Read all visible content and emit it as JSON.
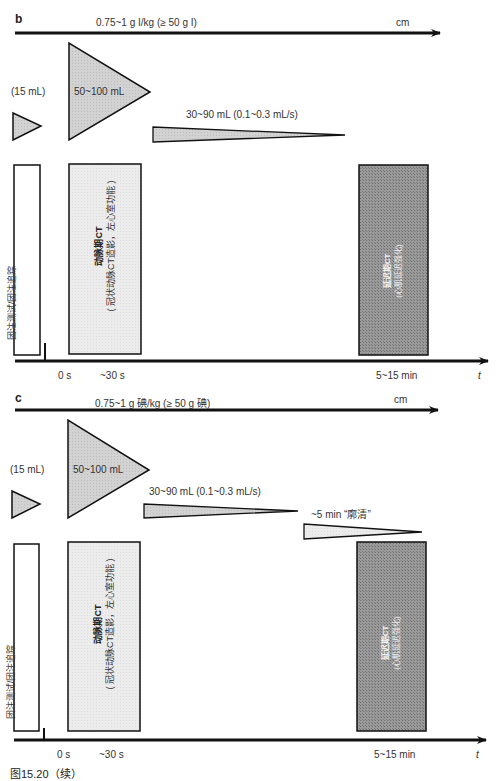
{
  "colors": {
    "line": "#111111",
    "triangle_fill": "#cccccc",
    "light_box_fill": "#ebebeb",
    "dark_box_fill": "#8a8a8a",
    "washout_fill": "#eeeeee"
  },
  "panels": [
    {
      "id": "b",
      "label": "b",
      "dose": "0.75~1 g I/kg (≥ 50 g I)",
      "dose_unit": "cm",
      "test_bolus": "(15 mL)",
      "main_bolus": "50~100 mL",
      "maintenance": "30~90 mL (0.1~0.3 mL/s)",
      "boxes": {
        "bolus_tracking": "团注测试/团注追踪",
        "arterial_title": "动脉期CT",
        "arterial_sub": "( 冠状动脉CT造影，左心室功能 )",
        "delayed_title": "延迟期CT",
        "delayed_sub": "(心肌延迟强化)"
      },
      "axis": {
        "t0": "0 s",
        "t1": "~30 s",
        "t2": "5~15 min",
        "t_label": "t"
      }
    },
    {
      "id": "c",
      "label": "c",
      "dose": "0.75~1 g 碘/kg (≥ 50 g 碘)",
      "dose_unit": "cm",
      "test_bolus": "(15 mL)",
      "main_bolus": "50~100 mL",
      "maintenance": "30~90 mL (0.1~0.3 mL/s)",
      "washout": "~5 min “廓清”",
      "boxes": {
        "bolus_tracking": "团注测试/团注追踪",
        "arterial_title": "动脉期CT",
        "arterial_sub": "( 冠状动脉CT造影，左心室功能 )",
        "delayed_title": "延迟期CT",
        "delayed_sub": "(心肌延迟强化)"
      },
      "axis": {
        "t0": "0 s",
        "t1": "~30 s",
        "t2": "5~15 min",
        "t_label": "t"
      }
    }
  ],
  "caption": "图15.20（续）"
}
